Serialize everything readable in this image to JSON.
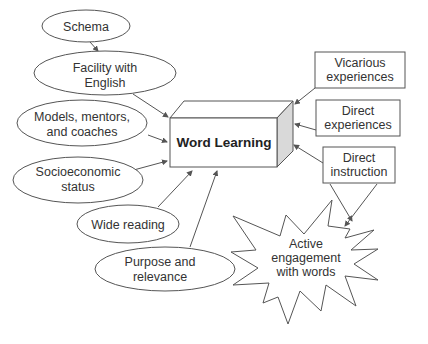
{
  "diagram": {
    "center": {
      "label": "Word Learning"
    },
    "left_factors": [
      {
        "line1": "Schema",
        "line2": ""
      },
      {
        "line1": "Facility with",
        "line2": "English"
      },
      {
        "line1": "Models, mentors,",
        "line2": "and coaches"
      },
      {
        "line1": "Socioeconomic",
        "line2": "status"
      },
      {
        "line1": "Wide reading",
        "line2": ""
      },
      {
        "line1": "Purpose and",
        "line2": "relevance"
      }
    ],
    "right_factors": [
      {
        "line1": "Vicarious",
        "line2": "experiences"
      },
      {
        "line1": "Direct",
        "line2": "experiences"
      },
      {
        "line1": "Direct",
        "line2": "instruction"
      }
    ],
    "starburst": {
      "line1": "Active",
      "line2": "engagement",
      "line3": "with words"
    },
    "colors": {
      "stroke": "#555555",
      "side_face": "#d9d9d9",
      "text": "#333333"
    }
  }
}
